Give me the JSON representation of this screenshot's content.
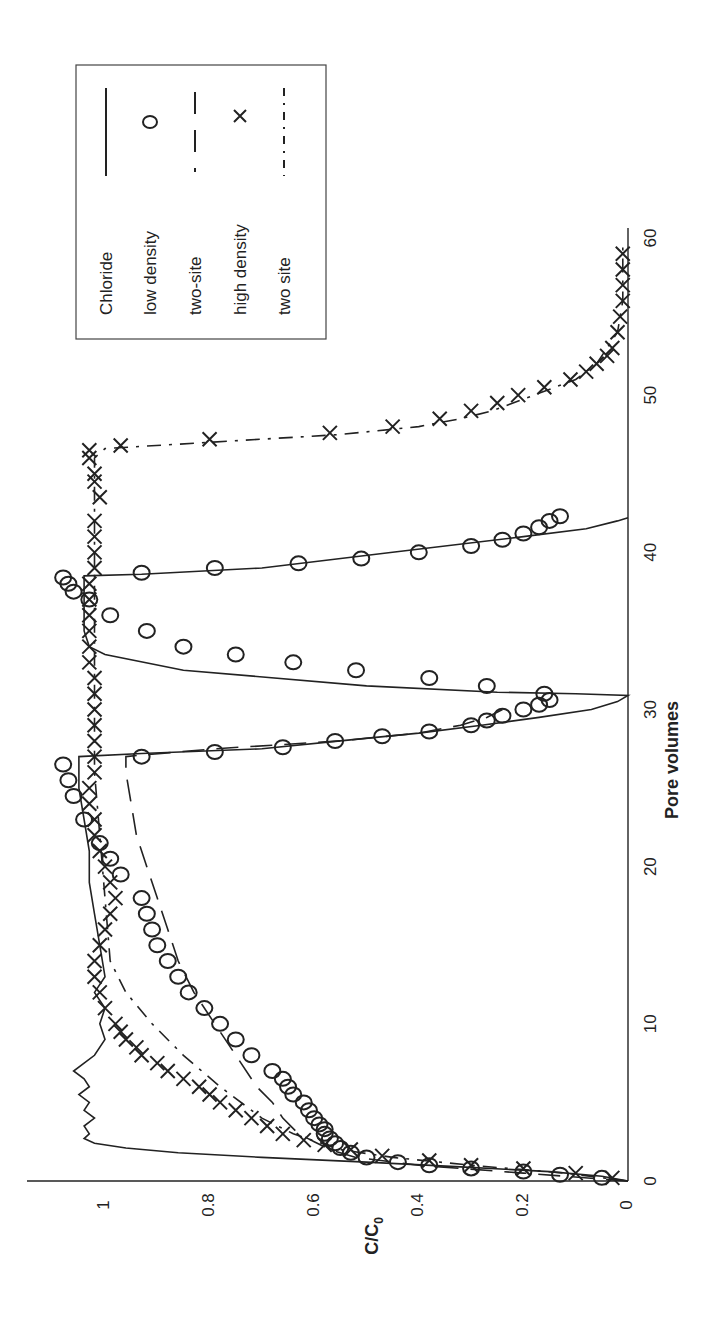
{
  "chart_data": {
    "type": "line",
    "orientation": "rotated-90-ccw",
    "title": "",
    "xlabel": "Pore volumes",
    "ylabel": "C/C0",
    "ylabel_display": "C/C",
    "ylabel_subscript": "0",
    "xlim": [
      0,
      60
    ],
    "ylim": [
      0,
      1.16
    ],
    "xticks": [
      0,
      10,
      20,
      30,
      40,
      50,
      60
    ],
    "xtick_labels": [
      "0",
      "10",
      "20",
      "30",
      "40",
      "50",
      "60"
    ],
    "yticks": [
      0,
      0.2,
      0.4,
      0.6,
      0.8,
      1
    ],
    "ytick_labels": [
      "0",
      "0.2",
      "0.4",
      "0.6",
      "0.8",
      "1"
    ],
    "grid": false,
    "legend_position": "upper right",
    "series": [
      {
        "name": "Chloride",
        "style": "solid-line",
        "x": [
          0,
          0.3,
          0.6,
          0.9,
          1.2,
          1.5,
          1.8,
          2.1,
          2.4,
          2.7,
          3.0,
          3.5,
          4.0,
          4.5,
          5.0,
          5.5,
          6.0,
          6.5,
          7.0,
          7.5,
          8.0,
          9.0,
          10.0,
          11.0,
          12.0,
          13.0,
          15.0,
          17.0,
          19.0,
          21.0,
          23.0,
          25.0,
          27.0,
          27.2,
          27.5,
          28.0,
          28.5,
          29.0,
          29.5,
          30.0,
          30.5,
          30.9,
          31.0,
          31.1,
          31.5,
          32.5,
          33.5,
          34.0,
          35.0,
          36.0,
          37.0,
          38.0,
          38.5,
          38.6,
          39.0,
          40.0,
          41.0,
          41.5,
          42.0,
          42.2
        ],
        "y": [
          0,
          0.05,
          0.15,
          0.32,
          0.5,
          0.7,
          0.86,
          0.96,
          1.02,
          1.04,
          1.03,
          1.04,
          1.02,
          1.04,
          1.03,
          1.05,
          1.03,
          1.04,
          1.06,
          1.04,
          1.02,
          1.0,
          1.01,
          1.0,
          1.02,
          1.0,
          1.01,
          1.02,
          1.03,
          1.03,
          1.04,
          1.05,
          1.05,
          0.93,
          0.7,
          0.55,
          0.4,
          0.28,
          0.17,
          0.07,
          0.02,
          0.0,
          0.1,
          0.25,
          0.5,
          0.85,
          1.0,
          1.03,
          1.04,
          1.04,
          1.04,
          1.04,
          1.04,
          0.93,
          0.7,
          0.45,
          0.2,
          0.08,
          0.02,
          0.0
        ]
      },
      {
        "name": "low density",
        "style": "circle-markers",
        "x": [
          0.2,
          0.4,
          0.6,
          0.8,
          1.0,
          1.2,
          1.5,
          1.8,
          2.1,
          2.4,
          2.7,
          3.0,
          3.3,
          3.6,
          4.0,
          4.5,
          5.0,
          5.5,
          6.0,
          6.5,
          7.0,
          8.0,
          9.0,
          10.0,
          11.0,
          12.0,
          13.0,
          14.0,
          15.0,
          16.0,
          17.0,
          18.0,
          19.5,
          20.5,
          21.5,
          23.0,
          24.5,
          25.5,
          26.5,
          27.0,
          27.3,
          27.6,
          28.0,
          28.3,
          28.6,
          29.0,
          29.3,
          29.6,
          30.0,
          30.3,
          30.6,
          31.0,
          31.5,
          32.0,
          32.5,
          33.0,
          33.5,
          34.0,
          35.0,
          36.0,
          37.0,
          37.5,
          38.0,
          38.4,
          38.7,
          39.0,
          39.3,
          39.6,
          40.0,
          40.4,
          40.8,
          41.2,
          41.6,
          42.0,
          42.3
        ],
        "y": [
          0.05,
          0.13,
          0.2,
          0.3,
          0.38,
          0.44,
          0.5,
          0.53,
          0.55,
          0.56,
          0.57,
          0.58,
          0.58,
          0.59,
          0.6,
          0.61,
          0.62,
          0.64,
          0.65,
          0.66,
          0.68,
          0.72,
          0.75,
          0.78,
          0.81,
          0.84,
          0.86,
          0.88,
          0.9,
          0.91,
          0.92,
          0.93,
          0.97,
          0.99,
          1.01,
          1.04,
          1.06,
          1.07,
          1.08,
          0.93,
          0.79,
          0.66,
          0.56,
          0.47,
          0.38,
          0.3,
          0.27,
          0.24,
          0.2,
          0.17,
          0.15,
          0.16,
          0.27,
          0.38,
          0.52,
          0.64,
          0.75,
          0.85,
          0.92,
          0.99,
          1.03,
          1.06,
          1.07,
          1.08,
          0.93,
          0.79,
          0.63,
          0.51,
          0.4,
          0.3,
          0.24,
          0.2,
          0.17,
          0.15,
          0.13
        ],
        "note": "approximate read-off"
      },
      {
        "name": "two-site",
        "style": "dashed-line",
        "x": [
          0,
          0.5,
          1.0,
          1.5,
          2.0,
          2.5,
          3.0,
          4.0,
          5.0,
          6.0,
          8.0,
          10.0,
          12.0,
          14.0,
          16.0,
          18.0,
          20.0,
          22.0,
          24.0,
          26.0,
          27.0,
          27.1,
          27.5,
          28.0,
          28.5,
          29.0,
          29.5,
          30.0
        ],
        "y": [
          0,
          0.2,
          0.4,
          0.52,
          0.57,
          0.6,
          0.63,
          0.66,
          0.68,
          0.71,
          0.75,
          0.79,
          0.83,
          0.86,
          0.88,
          0.9,
          0.92,
          0.94,
          0.95,
          0.96,
          0.96,
          0.93,
          0.79,
          0.55,
          0.4,
          0.32,
          0.27,
          0.24
        ]
      },
      {
        "name": "high density",
        "style": "x-markers",
        "x": [
          0.2,
          0.5,
          0.8,
          1.0,
          1.3,
          1.6,
          2.0,
          2.3,
          2.6,
          3.0,
          3.5,
          4.0,
          4.5,
          5.0,
          5.5,
          6.0,
          6.5,
          7.0,
          7.5,
          8.0,
          8.5,
          9.0,
          9.5,
          10.0,
          11.0,
          12.0,
          13.0,
          14.0,
          15.0,
          16.0,
          17.0,
          18.0,
          19.0,
          20.0,
          21.0,
          22.0,
          23.0,
          24.0,
          25.0,
          26.0,
          27.0,
          28.0,
          29.0,
          30.0,
          31.0,
          32.0,
          33.0,
          34.0,
          35.0,
          36.0,
          37.0,
          38.0,
          39.0,
          40.0,
          41.0,
          42.0,
          43.5,
          44.5,
          45.0,
          46.0,
          46.5,
          46.8,
          47.2,
          47.6,
          48.0,
          48.5,
          49.0,
          49.5,
          50.0,
          50.5,
          51.0,
          51.5,
          52.0,
          52.5,
          53.0,
          54.0,
          55.0,
          56.0,
          57.0,
          58.0,
          59.0
        ],
        "y": [
          0.03,
          0.1,
          0.2,
          0.3,
          0.38,
          0.47,
          0.53,
          0.58,
          0.62,
          0.66,
          0.69,
          0.72,
          0.75,
          0.78,
          0.8,
          0.82,
          0.85,
          0.88,
          0.9,
          0.93,
          0.94,
          0.96,
          0.97,
          0.98,
          1.0,
          1.01,
          1.02,
          1.02,
          1.01,
          1.0,
          0.99,
          0.98,
          0.99,
          1.0,
          1.01,
          1.02,
          1.02,
          1.03,
          1.03,
          1.02,
          1.02,
          1.02,
          1.02,
          1.02,
          1.02,
          1.02,
          1.03,
          1.03,
          1.03,
          1.03,
          1.03,
          1.03,
          1.02,
          1.02,
          1.02,
          1.02,
          1.01,
          1.02,
          1.02,
          1.03,
          1.03,
          0.97,
          0.8,
          0.57,
          0.45,
          0.36,
          0.3,
          0.25,
          0.21,
          0.16,
          0.11,
          0.08,
          0.06,
          0.04,
          0.03,
          0.02,
          0.015,
          0.01,
          0.01,
          0.01,
          0.01
        ],
        "note": "approximate read-off"
      },
      {
        "name": "two site",
        "style": "dash-dot-line",
        "x": [
          0,
          0.5,
          1.0,
          1.5,
          2.0,
          3.0,
          4.0,
          6.0,
          8.0,
          10.0,
          12.0,
          14.0,
          18.0,
          22.0,
          26.0,
          30.0,
          34.0,
          38.0,
          42.0,
          46.0,
          46.6,
          47.0,
          47.5,
          48.0,
          48.5,
          49.0,
          50.0,
          51.0,
          52.0,
          53.0,
          54.0,
          56.0,
          58.0,
          59.5
        ],
        "y": [
          0,
          0.12,
          0.3,
          0.45,
          0.55,
          0.64,
          0.7,
          0.78,
          0.85,
          0.91,
          0.96,
          0.99,
          1.0,
          1.01,
          1.02,
          1.02,
          1.02,
          1.02,
          1.02,
          1.02,
          1.0,
          0.8,
          0.55,
          0.4,
          0.32,
          0.26,
          0.18,
          0.1,
          0.06,
          0.04,
          0.02,
          0.01,
          0.01,
          0.01
        ]
      }
    ]
  },
  "legend": {
    "items": [
      {
        "label": "Chloride",
        "symbol": "solid-line"
      },
      {
        "label": "low density",
        "symbol": "circle"
      },
      {
        "label": "two-site",
        "symbol": "dashed-line"
      },
      {
        "label": "high density",
        "symbol": "x"
      },
      {
        "label": "two site",
        "symbol": "dash-dot-line"
      }
    ]
  },
  "colors": {
    "ink": "#222222",
    "background": "#ffffff"
  }
}
